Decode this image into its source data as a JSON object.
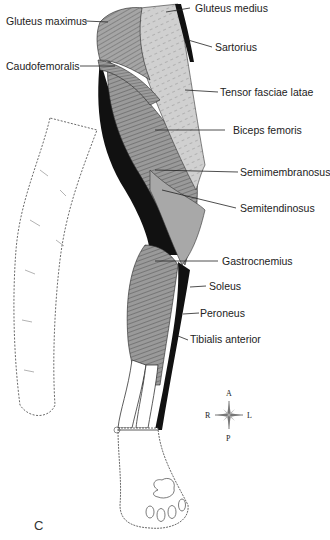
{
  "figure": {
    "panel_letter": "C",
    "labels": [
      {
        "id": "gluteus-maximus",
        "text": "Gluteus maximus",
        "side": "left"
      },
      {
        "id": "caudofemoralis",
        "text": "Caudofemoralis",
        "side": "left"
      },
      {
        "id": "gluteus-medius",
        "text": "Gluteus medius",
        "side": "right"
      },
      {
        "id": "sartorius",
        "text": "Sartorius",
        "side": "right"
      },
      {
        "id": "tensor-fasciae-latae",
        "text": "Tensor fasciae latae",
        "side": "right"
      },
      {
        "id": "biceps-femoris",
        "text": "Biceps femoris",
        "side": "right"
      },
      {
        "id": "semimembranosus",
        "text": "Semimembranosus",
        "side": "right"
      },
      {
        "id": "semitendinosus",
        "text": "Semitendinosus",
        "side": "right"
      },
      {
        "id": "gastrocnemius",
        "text": "Gastrocnemius",
        "side": "right"
      },
      {
        "id": "soleus",
        "text": "Soleus",
        "side": "right"
      },
      {
        "id": "peroneus",
        "text": "Peroneus",
        "side": "right"
      },
      {
        "id": "tibialis-anterior",
        "text": "Tibialis anterior",
        "side": "right"
      }
    ],
    "compass": {
      "up": "A",
      "down": "P",
      "left": "R",
      "right": "L"
    },
    "colors": {
      "light_muscle": "#cfcfcf",
      "mid_muscle": "#9a9a9a",
      "dark_muscle": "#7a7a7a",
      "deep": "#111111",
      "outline": "#222222",
      "skin": "#ffffff"
    }
  }
}
